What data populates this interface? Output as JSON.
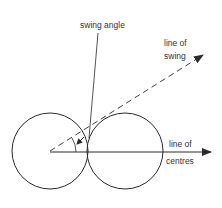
{
  "diagram": {
    "labels": {
      "swing_angle": "swing angle",
      "line_of_swing_1": "line of",
      "line_of_swing_2": "swing",
      "line_of_centres_1": "line of",
      "line_of_centres_2": "centres"
    },
    "colors": {
      "stroke": "#2a2a2a",
      "text": "#333333",
      "background": "#ffffff"
    },
    "shapes": {
      "left_circle": {
        "cx": 50,
        "cy": 151,
        "r": 38
      },
      "right_circle": {
        "cx": 125,
        "cy": 151,
        "r": 38
      }
    }
  }
}
